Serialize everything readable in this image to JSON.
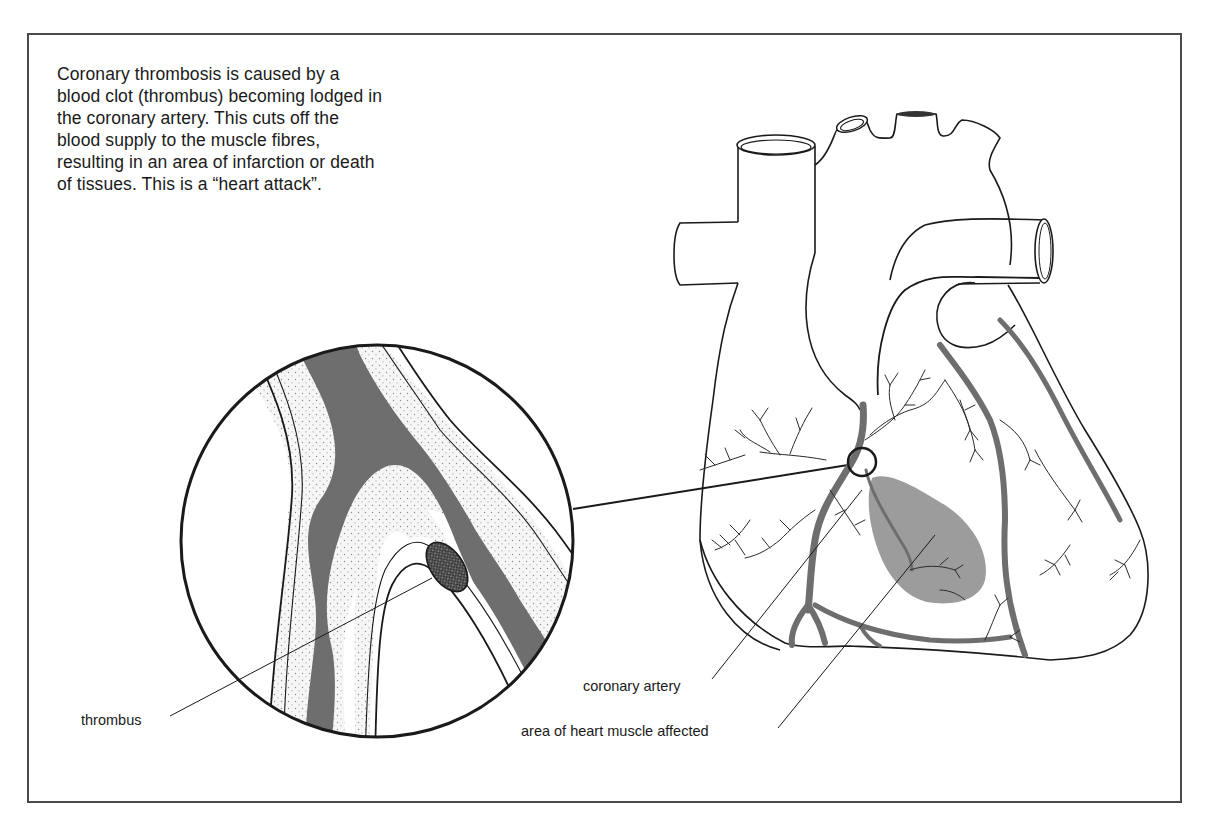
{
  "figure": {
    "caption": "Coronary thrombosis is caused by a blood clot (thrombus) becoming lodged in the coronary artery. This cuts off the blood supply to the muscle fibres, resulting in an area of infarction or death of tissues. This is a “heart attack”.",
    "labels": {
      "thrombus": "thrombus",
      "coronary_artery": "coronary artery",
      "affected_area": "area of heart muscle affected"
    },
    "colors": {
      "line": "#1a1a1a",
      "blood": "#6e6e6e",
      "infarct": "#9c9c9c",
      "artery_wall": "#f4f4f4",
      "frame": "#4a4a4a"
    }
  }
}
